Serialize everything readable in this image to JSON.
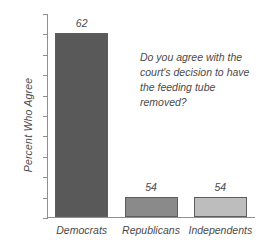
{
  "chart_data": {
    "type": "bar",
    "title": "",
    "subtitle": "",
    "xlabel": "",
    "ylabel": "Percent Who Agree",
    "categories": [
      "Democrats",
      "Republicans",
      "Independents"
    ],
    "values": [
      62,
      54,
      54
    ],
    "value_labels": [
      "62",
      "54",
      "54"
    ],
    "bar_colors": [
      "#595959",
      "#8a8a8a",
      "#bdbdbd"
    ],
    "bar_border_color": "#5d5d5d",
    "ylim": [
      53,
      63
    ],
    "ytick_step": 1,
    "ytick_labels": [
      "63",
      "62",
      "61",
      "60",
      "59",
      "58",
      "57",
      "56",
      "55",
      "54",
      "53"
    ],
    "grid": false,
    "legend": null,
    "annotations": [
      {
        "name": "survey-question",
        "text": "Do you agree with the court's decision to have the feeding tube removed?",
        "position": "upper-right"
      }
    ],
    "axis_color": "#8f8f8f",
    "background_color": "#ffffff",
    "text_color": "#4a4a4a"
  }
}
